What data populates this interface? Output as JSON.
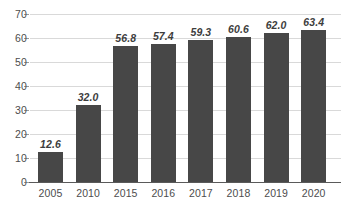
{
  "chart_data": {
    "type": "bar",
    "title": "",
    "xlabel": "",
    "ylabel": "",
    "categories": [
      "2005",
      "2010",
      "2015",
      "2016",
      "2017",
      "2018",
      "2019",
      "2020"
    ],
    "values": [
      12.6,
      32.0,
      56.8,
      57.4,
      59.3,
      60.6,
      62.0,
      63.4
    ],
    "value_labels": [
      "12.6",
      "32.0",
      "56.8",
      "57.4",
      "59.3",
      "60.6",
      "62.0",
      "63.4"
    ],
    "ylim": [
      0,
      70
    ],
    "yticks": [
      0,
      10,
      20,
      30,
      40,
      50,
      60,
      70
    ],
    "ytick_labels": [
      "0",
      "10",
      "20",
      "30",
      "40",
      "50",
      "60",
      "70"
    ],
    "grid": true,
    "legend": null,
    "series": [
      {
        "name": "",
        "values": [
          12.6,
          32.0,
          56.8,
          57.4,
          59.3,
          60.6,
          62.0,
          63.4
        ]
      }
    ],
    "colors": {
      "bar": "#474747",
      "gridline": "#d9d9d9",
      "axis": "#5a5a5a",
      "tick_text": "#4d4d4d",
      "value_label": "#3d3d3d",
      "background": "#ffffff"
    }
  }
}
